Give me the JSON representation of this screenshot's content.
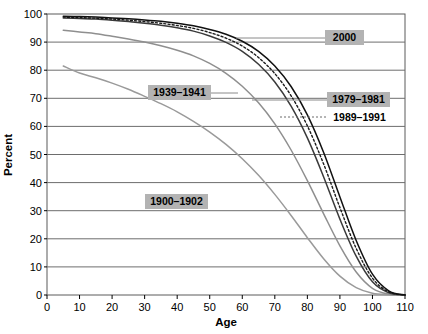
{
  "chart_data": {
    "type": "line",
    "title": "",
    "xlabel": "Age",
    "ylabel": "Percent",
    "xlim": [
      0,
      110
    ],
    "ylim": [
      0,
      100
    ],
    "xticks": [
      0,
      10,
      20,
      30,
      40,
      50,
      60,
      70,
      80,
      90,
      100,
      110
    ],
    "yticks": [
      0,
      10,
      20,
      30,
      40,
      50,
      60,
      70,
      80,
      90,
      100
    ],
    "grid": "horizontal",
    "legend_position": "inline-labels",
    "x": [
      0,
      5,
      10,
      15,
      20,
      25,
      30,
      35,
      40,
      45,
      50,
      55,
      60,
      65,
      70,
      75,
      80,
      85,
      90,
      95,
      100,
      105,
      110
    ],
    "series": [
      {
        "name": "1900–1902",
        "style": "solid",
        "color": "#9a9a9a",
        "values": [
          100,
          81.5,
          79.0,
          77.3,
          75.4,
          73.2,
          70.7,
          68.1,
          65.2,
          61.8,
          58.0,
          53.6,
          48.5,
          42.6,
          35.8,
          28.3,
          20.4,
          12.9,
          6.7,
          2.6,
          0.6,
          0.1,
          0
        ]
      },
      {
        "name": "1939–1941",
        "style": "solid",
        "color": "#8f8f8f",
        "values": [
          100,
          94.2,
          93.6,
          93.0,
          92.1,
          91.1,
          90.0,
          88.7,
          87.1,
          85.1,
          82.4,
          78.9,
          74.3,
          68.4,
          60.9,
          51.6,
          40.7,
          28.9,
          17.5,
          8.2,
          2.4,
          0.3,
          0
        ]
      },
      {
        "name": "1979–1981",
        "style": "solid",
        "color": "#3a3a3a",
        "values": [
          100,
          98.6,
          98.4,
          98.2,
          97.8,
          97.3,
          96.7,
          96.0,
          95.1,
          93.9,
          92.2,
          89.9,
          86.7,
          82.1,
          75.8,
          67.2,
          55.9,
          42.0,
          27.0,
          13.8,
          4.7,
          0.8,
          0
        ]
      },
      {
        "name": "1989–1991",
        "style": "dotted",
        "color": "#1a1a1a",
        "values": [
          100,
          98.9,
          98.7,
          98.5,
          98.2,
          97.8,
          97.3,
          96.7,
          95.9,
          94.9,
          93.4,
          91.4,
          88.6,
          84.5,
          78.8,
          70.9,
          60.2,
          46.6,
          31.1,
          16.6,
          6.0,
          1.1,
          0
        ]
      },
      {
        "name": "2000",
        "style": "solid",
        "color": "#111111",
        "values": [
          100,
          99.2,
          99.1,
          98.9,
          98.6,
          98.3,
          97.9,
          97.4,
          96.7,
          95.8,
          94.5,
          92.8,
          90.3,
          86.7,
          81.5,
          74.2,
          64.1,
          50.7,
          34.9,
          19.4,
          7.4,
          1.5,
          0
        ]
      }
    ],
    "annotations": [
      {
        "label": "2000",
        "boxed": true,
        "leader": "solid"
      },
      {
        "label": "1979–1981",
        "boxed": true,
        "leader": "solid"
      },
      {
        "label": "1989–1991",
        "boxed": false,
        "leader": "dotted"
      },
      {
        "label": "1939–1941",
        "boxed": true,
        "leader": "solid"
      },
      {
        "label": "1900–1902",
        "boxed": true,
        "leader": "none"
      }
    ]
  },
  "axes": {
    "x_title": "Age",
    "y_title": "Percent",
    "x_tick_labels": [
      "0",
      "10",
      "20",
      "30",
      "40",
      "50",
      "60",
      "70",
      "80",
      "90",
      "100",
      "110"
    ],
    "y_tick_labels": [
      "0",
      "10",
      "20",
      "30",
      "40",
      "50",
      "60",
      "70",
      "80",
      "90",
      "100"
    ]
  },
  "labels": {
    "l2000": "2000",
    "l1979": "1979–1981",
    "l1989": "1989–1991",
    "l1939": "1939–1941",
    "l1900": "1900–1902"
  },
  "colors": {
    "background": "#ffffff",
    "grid": "#6d6d6d",
    "axis": "#000000",
    "label_box": "#b3b3b3",
    "curve_dark": "#111111",
    "curve_mid": "#3a3a3a",
    "curve_light": "#8f8f8f",
    "curve_lightest": "#9a9a9a"
  }
}
